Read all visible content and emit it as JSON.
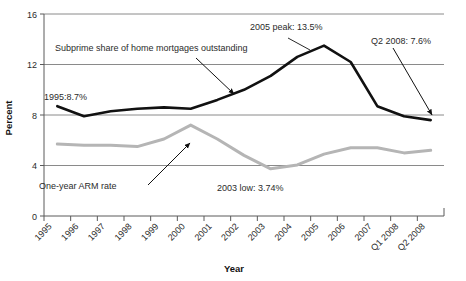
{
  "chart_data": {
    "type": "line",
    "title": "",
    "xlabel": "Year",
    "ylabel": "Percent",
    "ylim": [
      0,
      16
    ],
    "yticks": [
      0,
      4,
      8,
      12,
      16
    ],
    "grid": true,
    "legend": "none",
    "categories": [
      "1995",
      "1996",
      "1997",
      "1998",
      "1999",
      "2000",
      "2001",
      "2002",
      "2003",
      "2004",
      "2005",
      "2006",
      "2007",
      "Q1 2008",
      "Q2 2008"
    ],
    "series": [
      {
        "name": "Subprime share of home mortgages outstanding",
        "color": "#111111",
        "values": [
          8.7,
          7.9,
          8.3,
          8.5,
          8.6,
          8.5,
          9.2,
          10.0,
          11.1,
          12.6,
          13.5,
          12.2,
          8.7,
          7.9,
          7.6
        ]
      },
      {
        "name": "One-year ARM rate",
        "color": "#b5b5b5",
        "values": [
          5.7,
          5.6,
          5.6,
          5.5,
          6.1,
          7.2,
          6.1,
          4.8,
          3.74,
          4.05,
          4.9,
          5.4,
          5.4,
          5.0,
          5.2
        ]
      }
    ],
    "annotations": [
      {
        "id": "subprime-series-label",
        "text": "Subprime share of home mortgages outstanding"
      },
      {
        "id": "arm-series-label",
        "text": "One-year ARM rate"
      },
      {
        "id": "peak-2005-label",
        "text": "2005 peak: 13.5%"
      },
      {
        "id": "low-2003-label",
        "text": "2003 low: 3.74%"
      },
      {
        "id": "start-1995-label",
        "text": "1995:8.7%"
      },
      {
        "id": "end-q2-2008-label",
        "text": "Q2 2008: 7.6%"
      }
    ]
  },
  "axis": {
    "y_title": "Percent",
    "x_title": "Year",
    "y_tick_0": "0",
    "y_tick_1": "4",
    "y_tick_2": "8",
    "y_tick_3": "12",
    "y_tick_4": "16"
  },
  "colors": {
    "subprime_line": "#111111",
    "arm_line": "#b5b5b5",
    "grid": "#8a8a8a",
    "axis": "#5a5a5a",
    "text": "#2b2b2b"
  }
}
